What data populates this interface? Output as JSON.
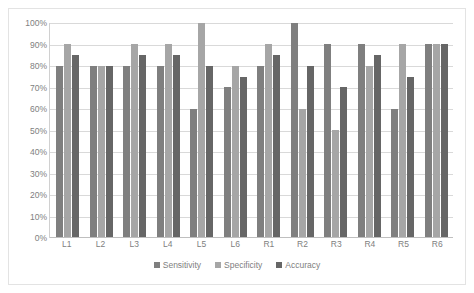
{
  "chart_data": {
    "type": "bar",
    "title": "",
    "subtitle": "",
    "xlabel": "",
    "ylabel": "",
    "ylim": [
      0,
      100
    ],
    "yticks": [
      "0%",
      "10%",
      "20%",
      "30%",
      "40%",
      "50%",
      "60%",
      "70%",
      "80%",
      "90%",
      "100%"
    ],
    "ytick_values": [
      0,
      10,
      20,
      30,
      40,
      50,
      60,
      70,
      80,
      90,
      100
    ],
    "grid": true,
    "legend_position": "bottom",
    "categories": [
      "L1",
      "L2",
      "L3",
      "L4",
      "L5",
      "L6",
      "R1",
      "R2",
      "R3",
      "R4",
      "R5",
      "R6"
    ],
    "series": [
      {
        "name": "Sensitivity",
        "color": "#7f7f7f",
        "values": [
          80,
          80,
          80,
          80,
          60,
          70,
          80,
          100,
          90,
          90,
          60,
          90
        ]
      },
      {
        "name": "Specificity",
        "color": "#a6a6a6",
        "values": [
          90,
          80,
          90,
          90,
          100,
          80,
          90,
          60,
          50,
          80,
          90,
          90
        ]
      },
      {
        "name": "Accuracy",
        "color": "#666666",
        "values": [
          85,
          80,
          85,
          85,
          80,
          75,
          85,
          80,
          70,
          85,
          75,
          90
        ]
      }
    ]
  },
  "colors": {
    "sensitivity": "#7f7f7f",
    "specificity": "#a6a6a6",
    "accuracy": "#666666",
    "gridline": "#d9d9d9",
    "axis": "#bfbfbf",
    "border": "#e3e3e3",
    "tick_text": "#808080",
    "background": "#ffffff"
  }
}
